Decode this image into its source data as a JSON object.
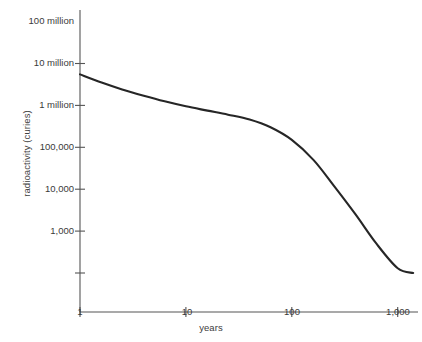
{
  "chart_data": {
    "type": "line",
    "title": "",
    "xlabel": "years",
    "ylabel": "radioactivity (curies)",
    "xscale": "log",
    "yscale": "log",
    "xlim": [
      1,
      1500
    ],
    "ylim": [
      1000,
      100000000
    ],
    "grid": false,
    "legend": null,
    "x_tick_labels": [
      "1",
      "10",
      "100",
      "1,000"
    ],
    "x_tick_values": [
      1,
      10,
      100,
      1000
    ],
    "y_tick_labels": [
      "100 million",
      "10 million",
      "1 million",
      "100,000",
      "10,000",
      "1,000"
    ],
    "y_tick_values": [
      100000000,
      10000000,
      1000000,
      100000,
      10000,
      1000
    ],
    "series": [
      {
        "name": "radioactivity",
        "x": [
          1,
          1.6,
          2.5,
          4,
          6.3,
          10,
          16,
          25,
          40,
          63,
          100,
          160,
          250,
          400,
          630,
          1000,
          1400
        ],
        "y": [
          55000000,
          35000000,
          24000000,
          17000000,
          12500000,
          9500000,
          7500000,
          6000000,
          4600000,
          3000000,
          1500000,
          500000,
          120000,
          25000,
          5000,
          1300,
          1000
        ]
      }
    ]
  },
  "axes": {
    "line_color": "#555555",
    "curve_color": "#262626"
  }
}
